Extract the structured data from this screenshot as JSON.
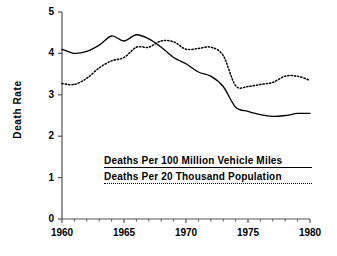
{
  "chart_data": {
    "type": "line",
    "title": "",
    "xlabel": "",
    "ylabel": "Death Rate",
    "xlim": [
      1960,
      1980
    ],
    "ylim": [
      0,
      5
    ],
    "grid": false,
    "legend_position": "inside-lower-center",
    "x": [
      1960,
      1961,
      1962,
      1963,
      1964,
      1965,
      1966,
      1967,
      1968,
      1969,
      1970,
      1971,
      1972,
      1973,
      1974,
      1975,
      1976,
      1977,
      1978,
      1979,
      1980
    ],
    "xticks": [
      1960,
      1965,
      1970,
      1975,
      1980
    ],
    "xtick_labels": [
      "1960",
      "1965",
      "1970",
      "1975",
      "1980"
    ],
    "xminorticks": [
      1961,
      1962,
      1963,
      1964,
      1966,
      1967,
      1968,
      1969,
      1971,
      1972,
      1973,
      1974,
      1976,
      1977,
      1978,
      1979
    ],
    "yticks": [
      0,
      1,
      2,
      3,
      4,
      5
    ],
    "ytick_labels": [
      "0",
      "1",
      "2",
      "3",
      "4",
      "5"
    ],
    "series": [
      {
        "name": "Deaths Per 100 Million Vehicle Miles",
        "style": "solid",
        "color": "#000000",
        "values": [
          4.1,
          4.0,
          4.05,
          4.2,
          4.42,
          4.3,
          4.45,
          4.35,
          4.15,
          3.9,
          3.75,
          3.55,
          3.45,
          3.2,
          2.7,
          2.6,
          2.52,
          2.48,
          2.5,
          2.55,
          2.55
        ]
      },
      {
        "name": "Deaths Per 20 Thousand Population",
        "style": "dotted",
        "color": "#000000",
        "values": [
          3.27,
          3.25,
          3.4,
          3.65,
          3.82,
          3.9,
          4.15,
          4.15,
          4.3,
          4.28,
          4.1,
          4.12,
          4.15,
          3.95,
          3.22,
          3.2,
          3.25,
          3.3,
          3.45,
          3.45,
          3.35
        ]
      }
    ]
  },
  "axis": {
    "y_title": "Death Rate"
  },
  "legend": {
    "entries": [
      {
        "label": "Deaths Per 100 Million Vehicle Miles",
        "style": "solid"
      },
      {
        "label": "Deaths Per 20 Thousand Population",
        "style": "dotted"
      }
    ]
  },
  "colors": {
    "line": "#000000",
    "axis": "#555555",
    "background": "#ffffff"
  }
}
